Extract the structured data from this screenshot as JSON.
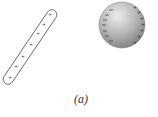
{
  "figure": {
    "caption": "(a)",
    "rod": {
      "label": "positively charged rod",
      "charges": [
        "+",
        "+",
        "+",
        "+",
        "+",
        "+",
        "+"
      ],
      "stroke_color": "#555555"
    },
    "sphere": {
      "label": "conducting sphere with induced charge",
      "left_side_charges": [
        "-",
        "-",
        "-",
        "-",
        "-",
        "-",
        "-"
      ],
      "right_side_charges": [
        "+",
        "+",
        "+",
        "+",
        "+",
        "+",
        "+"
      ],
      "fill_light": "#e6e6e6",
      "fill_dark": "#8a8a8a"
    }
  }
}
